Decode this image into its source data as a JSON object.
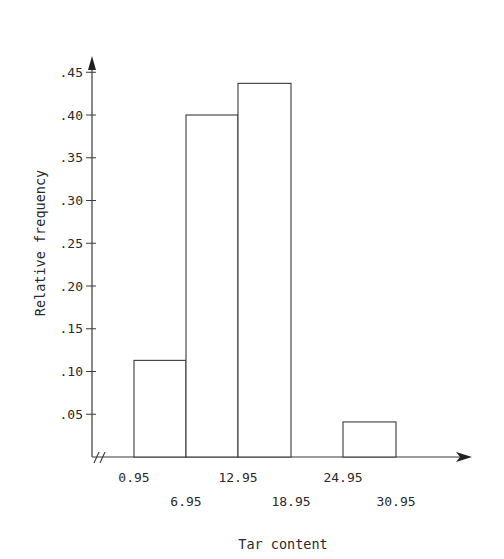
{
  "chart_data": {
    "type": "bar",
    "subtype": "histogram",
    "title": "",
    "xlabel": "Tar content",
    "ylabel": "Relative frequency",
    "bin_edges": [
      0.95,
      6.95,
      12.95,
      18.95,
      24.95,
      30.95
    ],
    "x_tick_labels": [
      "0.95",
      "6.95",
      "12.95",
      "18.95",
      "24.95",
      "30.95"
    ],
    "categories": [
      "0.95-6.95",
      "6.95-12.95",
      "12.95-18.95",
      "18.95-24.95",
      "24.95-30.95"
    ],
    "values": [
      0.113,
      0.4,
      0.437,
      0,
      0.041
    ],
    "y_ticks": [
      0.05,
      0.1,
      0.15,
      0.2,
      0.25,
      0.3,
      0.35,
      0.4,
      0.45
    ],
    "y_tick_labels": [
      ".05",
      ".10",
      ".15",
      ".20",
      ".25",
      ".30",
      ".35",
      ".40",
      ".45"
    ],
    "ylim": [
      0,
      0.48
    ],
    "grid": false,
    "legend": null,
    "axis_break": "x-axis break marks (//) near origin"
  },
  "layout": {
    "origin_x": 92,
    "origin_y": 457,
    "px_per_unit_y": 855,
    "bin_x": [
      134,
      186,
      238,
      291,
      343,
      396
    ],
    "x_axis_end": 470,
    "y_axis_top": 58,
    "line_color": "#3a3a3a"
  }
}
